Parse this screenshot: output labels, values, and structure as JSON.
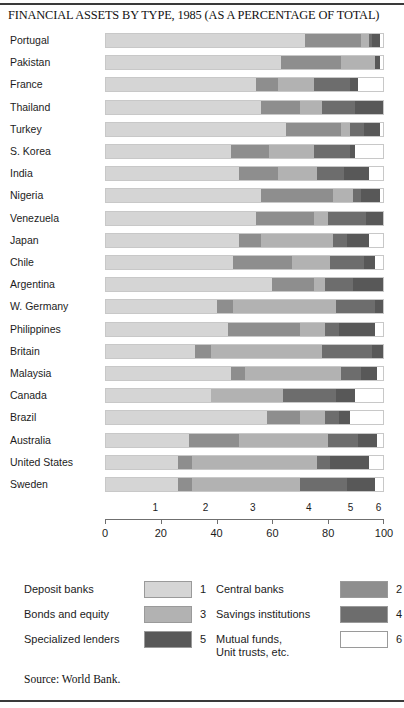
{
  "chart_title": "FINANCIAL ASSETS BY TYPE, 1985 (AS A PERCENTAGE OF TOTAL)",
  "source": "Source: World Bank.",
  "colors": {
    "deposit_banks": "#d5d5d5",
    "central_banks": "#8e8e8e",
    "bonds_and_equity": "#b2b2b2",
    "savings_institutions": "#6d6d6d",
    "specialized_lenders": "#585858",
    "mutual_funds": "#ffffff",
    "outline": "#9a9a9a",
    "rule": "#3a3a3a"
  },
  "legend": {
    "items": [
      {
        "label": "Deposit banks",
        "number": "1",
        "color": "#d5d5d5",
        "col": 0,
        "row": 0
      },
      {
        "label": "Central banks",
        "number": "2",
        "color": "#8e8e8e",
        "col": 1,
        "row": 0
      },
      {
        "label": "Bonds and equity",
        "number": "3",
        "color": "#b2b2b2",
        "col": 0,
        "row": 1
      },
      {
        "label": "Savings institutions",
        "number": "4",
        "color": "#6d6d6d",
        "col": 1,
        "row": 1
      },
      {
        "label": "Specialized lenders",
        "number": "5",
        "color": "#585858",
        "col": 0,
        "row": 2
      },
      {
        "label": "Mutual funds,",
        "label2": "Unit trusts, etc.",
        "number": "6",
        "color": "#ffffff",
        "col": 1,
        "row": 2
      }
    ]
  },
  "segment_number_axis": {
    "labels": [
      "1",
      "2",
      "3",
      "4",
      "5",
      "6"
    ],
    "positions_pct": [
      18,
      36,
      53,
      73,
      88,
      98
    ]
  },
  "percent_axis": {
    "ticks": [
      0,
      20,
      40,
      60,
      80,
      100
    ],
    "labels": [
      "0",
      "20",
      "40",
      "60",
      "80",
      "100"
    ]
  },
  "chart_data": {
    "type": "bar",
    "orientation": "horizontal",
    "stacked": true,
    "normalized_to_100": true,
    "title": "FINANCIAL ASSETS BY TYPE, 1985 (AS A PERCENTAGE OF TOTAL)",
    "xlabel": "",
    "ylabel": "",
    "xlim": [
      0,
      100
    ],
    "grid": false,
    "legend_position": "bottom",
    "categories": [
      "Portugal",
      "Pakistan",
      "France",
      "Thailand",
      "Turkey",
      "S. Korea",
      "India",
      "Nigeria",
      "Venezuela",
      "Japan",
      "Chile",
      "Argentina",
      "W. Germany",
      "Philippines",
      "Britain",
      "Malaysia",
      "Canada",
      "Brazil",
      "Australia",
      "United States",
      "Sweden"
    ],
    "series": [
      {
        "name": "Deposit banks",
        "number": 1,
        "color": "#d5d5d5",
        "values": [
          72,
          63,
          54,
          56,
          65,
          45,
          48,
          56,
          54,
          48,
          46,
          60,
          40,
          44,
          32,
          45,
          38,
          58,
          30,
          26,
          26
        ]
      },
      {
        "name": "Central banks",
        "number": 2,
        "color": "#8e8e8e",
        "values": [
          20,
          22,
          8,
          14,
          20,
          14,
          14,
          26,
          21,
          8,
          21,
          15,
          6,
          26,
          6,
          5,
          0,
          12,
          18,
          5,
          5
        ]
      },
      {
        "name": "Bonds and equity",
        "number": 3,
        "color": "#b2b2b2",
        "values": [
          3,
          12,
          13,
          8,
          3,
          16,
          14,
          7,
          5,
          26,
          14,
          4,
          37,
          9,
          40,
          35,
          26,
          9,
          32,
          45,
          39
        ]
      },
      {
        "name": "Savings institutions",
        "number": 4,
        "color": "#6d6d6d",
        "values": [
          1,
          0,
          13,
          12,
          5,
          13,
          10,
          3,
          14,
          5,
          12,
          10,
          14,
          5,
          18,
          7,
          19,
          5,
          11,
          5,
          17
        ]
      },
      {
        "name": "Specialized lenders",
        "number": 5,
        "color": "#585858",
        "values": [
          3,
          2,
          3,
          10,
          6,
          2,
          9,
          7,
          6,
          8,
          4,
          11,
          3,
          13,
          4,
          6,
          7,
          4,
          7,
          14,
          10
        ]
      },
      {
        "name": "Mutual funds, Unit trusts, etc.",
        "number": 6,
        "color": "#ffffff",
        "values": [
          1,
          1,
          9,
          0,
          1,
          10,
          5,
          1,
          0,
          5,
          3,
          0,
          0,
          3,
          0,
          2,
          10,
          12,
          2,
          5,
          3
        ]
      }
    ]
  }
}
